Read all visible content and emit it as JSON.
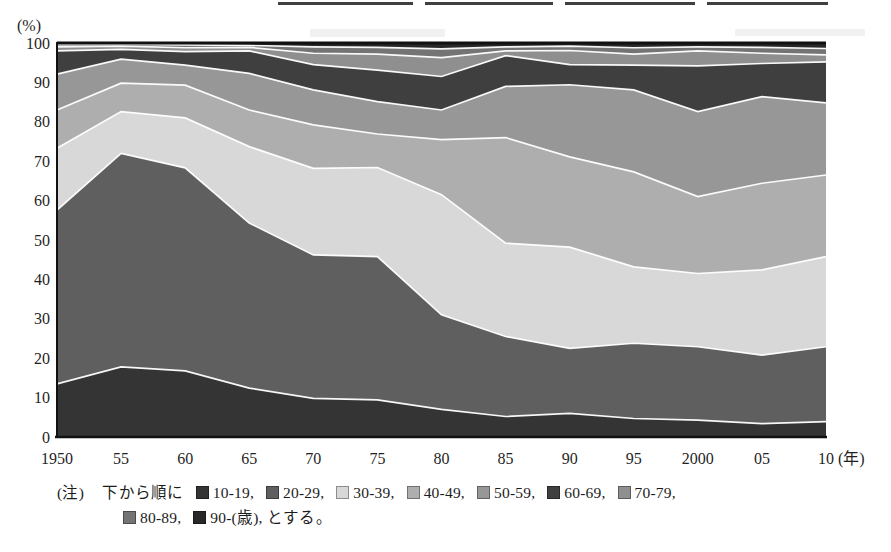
{
  "y_axis": {
    "unit": "(%)",
    "ticks": [
      "100",
      "90",
      "80",
      "70",
      "60",
      "50",
      "40",
      "30",
      "20",
      "10",
      "0"
    ]
  },
  "x_axis": {
    "ticks": [
      "1950",
      "55",
      "60",
      "65",
      "70",
      "75",
      "80",
      "85",
      "90",
      "95",
      "2000",
      "05",
      "10"
    ],
    "unit_suffix": "(年)"
  },
  "note": {
    "tag": "(注)",
    "intro": "下から順に",
    "separator": ", ",
    "age_suffix": "(歳)",
    "outro": "とする。",
    "items_per_first_line": 7
  },
  "chart_data": {
    "type": "area",
    "stacked": true,
    "percent": true,
    "title": "",
    "xlabel": "(年)",
    "ylabel": "(%)",
    "ylim": [
      0,
      100
    ],
    "grid": false,
    "legend_position": "footnote below chart",
    "stack_order": "bottom to top",
    "x": [
      1950,
      1955,
      1960,
      1965,
      1970,
      1975,
      1980,
      1985,
      1990,
      1995,
      2000,
      2005,
      2010
    ],
    "series": [
      {
        "name": "10-19",
        "color": "#343434",
        "values": [
          13.5,
          17.8,
          16.8,
          12.4,
          9.8,
          9.4,
          7.0,
          5.2,
          6.0,
          4.7,
          4.3,
          3.4,
          3.9
        ]
      },
      {
        "name": "20-29",
        "color": "#5f5f5f",
        "values": [
          44.1,
          54.2,
          51.5,
          41.9,
          36.4,
          36.4,
          24.0,
          20.3,
          16.5,
          19.1,
          18.6,
          17.4,
          19.0
        ]
      },
      {
        "name": "30-39",
        "color": "#d8d8d8",
        "values": [
          15.7,
          10.6,
          12.7,
          19.4,
          22.0,
          22.6,
          30.5,
          23.7,
          25.7,
          19.4,
          18.6,
          21.6,
          22.9
        ]
      },
      {
        "name": "40-49",
        "color": "#aeaeae",
        "values": [
          9.7,
          7.2,
          8.3,
          9.3,
          11.0,
          8.5,
          14.0,
          26.8,
          22.9,
          24.1,
          19.5,
          22.0,
          20.7
        ]
      },
      {
        "name": "50-59",
        "color": "#979797",
        "values": [
          9.1,
          6.1,
          5.1,
          9.3,
          8.9,
          8.2,
          7.5,
          13.0,
          18.3,
          20.8,
          21.6,
          22.0,
          18.3
        ]
      },
      {
        "name": "60-69",
        "color": "#3f3f3f",
        "values": [
          5.9,
          2.5,
          3.4,
          5.7,
          6.4,
          8.0,
          8.5,
          7.8,
          5.1,
          6.3,
          11.6,
          8.4,
          10.4
        ]
      },
      {
        "name": "70-79",
        "color": "#8f8f8f",
        "values": [
          1.0,
          0.8,
          1.0,
          0.9,
          2.9,
          4.1,
          4.8,
          1.2,
          3.6,
          2.8,
          3.8,
          2.6,
          1.8
        ]
      },
      {
        "name": "80-89",
        "color": "#747474",
        "values": [
          0.6,
          0.5,
          0.7,
          0.5,
          1.6,
          1.7,
          2.2,
          1.0,
          1.1,
          1.6,
          1.0,
          1.5,
          1.6
        ]
      },
      {
        "name": "90-",
        "color": "#282828",
        "values": [
          0.4,
          0.3,
          0.5,
          0.6,
          1.0,
          1.1,
          1.5,
          1.0,
          0.8,
          1.2,
          1.0,
          1.1,
          1.4
        ]
      }
    ]
  }
}
